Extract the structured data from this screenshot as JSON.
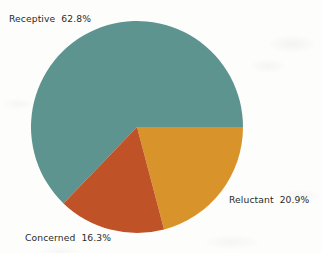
{
  "chart_data": {
    "type": "pie",
    "title": "",
    "subtitle": "",
    "xlabel": "",
    "ylabel": "",
    "legend_position": "none",
    "grid": false,
    "labels_placement": "outside-adjacent",
    "start_angle_deg": 0,
    "direction": "clockwise",
    "categories": [
      "Receptive",
      "Reluctant",
      "Concerned"
    ],
    "values": [
      62.8,
      20.9,
      16.3
    ],
    "value_unit": "%",
    "colors": [
      "#5d9490",
      "#d8942a",
      "#c05228"
    ],
    "slices": [
      {
        "name": "Receptive",
        "value": 62.8,
        "label": "Receptive  62.8%",
        "color": "#5d9490",
        "start_angle_deg": 133.9,
        "sweep_deg": 226.1
      },
      {
        "name": "Reluctant",
        "value": 20.9,
        "label": "Reluctant  20.9%",
        "color": "#d8942a",
        "start_angle_deg": 0,
        "sweep_deg": 75.2
      },
      {
        "name": "Concerned",
        "value": 16.3,
        "label": "Concerned  16.3%",
        "color": "#c05228",
        "start_angle_deg": 75.2,
        "sweep_deg": 58.7
      }
    ]
  },
  "geometry": {
    "center_x": 137,
    "center_y": 127,
    "radius": 106
  },
  "style": {
    "background": "#fdfdfc",
    "text_color": "#2b2b2b"
  }
}
